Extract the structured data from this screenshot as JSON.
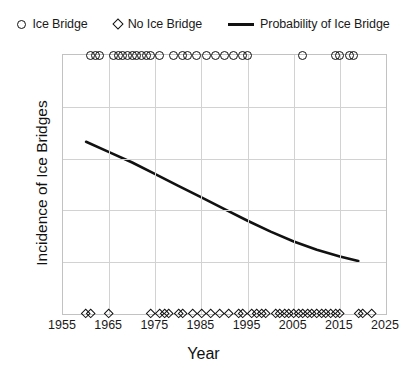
{
  "legend": {
    "position": "top",
    "entries": [
      {
        "label": "Ice Bridge",
        "marker": "circle-icon"
      },
      {
        "label": "No Ice Bridge",
        "marker": "diamond-icon"
      },
      {
        "label": "Probability of Ice Bridge",
        "marker": "line-icon"
      }
    ]
  },
  "chart_data": {
    "type": "scatter",
    "title": "",
    "xlabel": "Year",
    "ylabel": "Incidence of Ice Bridges",
    "xlim": [
      1955,
      2025
    ],
    "ylim": [
      0,
      1
    ],
    "grid": true,
    "xticks": [
      1955,
      1965,
      1975,
      1985,
      1995,
      2005,
      2015,
      2025
    ],
    "xtick_labels": [
      "1955",
      "1965",
      "1975",
      "1985",
      "1995",
      "2005",
      "2015",
      "2025"
    ],
    "yticks": [
      0,
      0.2,
      0.4,
      0.6,
      0.8,
      1
    ],
    "ytick_labels": [
      "0",
      "0.2",
      "0.4",
      "0.6",
      "0.8",
      "1"
    ],
    "series": [
      {
        "name": "Ice Bridge",
        "marker": "circle",
        "y_value": 1,
        "x": [
          1961,
          1962,
          1963,
          1966,
          1967,
          1968,
          1969,
          1970,
          1971,
          1972,
          1973,
          1974,
          1976,
          1979,
          1981,
          1982,
          1984,
          1986,
          1988,
          1990,
          1992,
          1994,
          1995,
          2007,
          2014,
          2015,
          2017,
          2018
        ]
      },
      {
        "name": "No Ice Bridge",
        "marker": "diamond",
        "y_value": 0,
        "x": [
          1960,
          1961,
          1965,
          1974,
          1976,
          1977,
          1978,
          1980,
          1981,
          1983,
          1985,
          1987,
          1989,
          1991,
          1993,
          1994,
          1996,
          1997,
          1998,
          1999,
          2001,
          2002,
          2003,
          2004,
          2005,
          2006,
          2007,
          2008,
          2009,
          2010,
          2011,
          2012,
          2013,
          2014,
          2015,
          2019,
          2020,
          2022
        ]
      },
      {
        "name": "Probability of Ice Bridge",
        "marker": "line",
        "points": [
          {
            "x": 1960,
            "y": 0.665
          },
          {
            "x": 1965,
            "y": 0.625
          },
          {
            "x": 1970,
            "y": 0.585
          },
          {
            "x": 1975,
            "y": 0.54
          },
          {
            "x": 1980,
            "y": 0.495
          },
          {
            "x": 1985,
            "y": 0.45
          },
          {
            "x": 1990,
            "y": 0.405
          },
          {
            "x": 1995,
            "y": 0.36
          },
          {
            "x": 2000,
            "y": 0.318
          },
          {
            "x": 2005,
            "y": 0.28
          },
          {
            "x": 2010,
            "y": 0.248
          },
          {
            "x": 2015,
            "y": 0.222
          },
          {
            "x": 2019,
            "y": 0.205
          }
        ]
      }
    ]
  }
}
